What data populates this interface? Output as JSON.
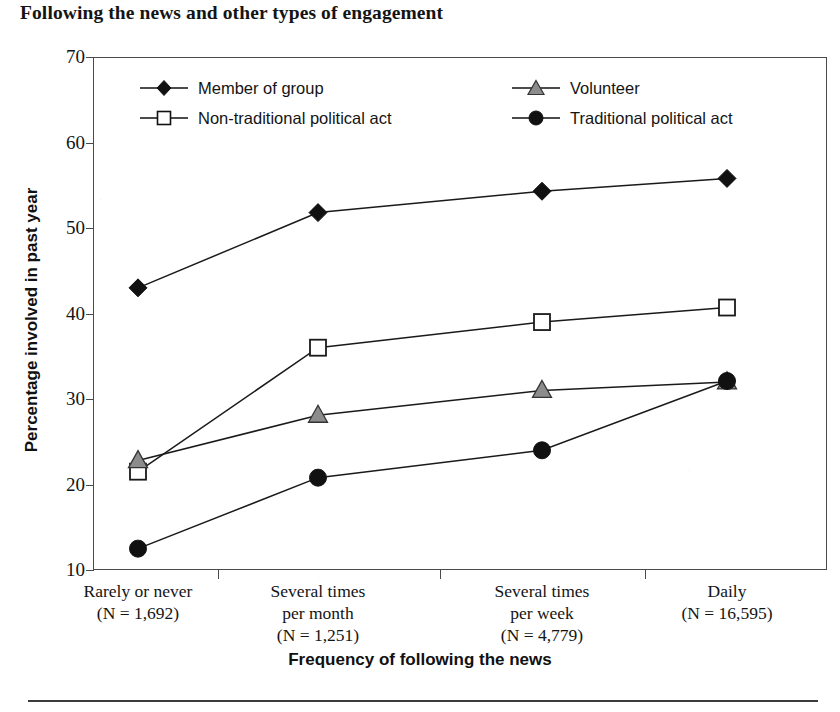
{
  "title": "Following the news and other types of engagement",
  "axis": {
    "y_title": "Percentage involved in past year",
    "x_title": "Frequency of following the news",
    "y_ticks": [
      "70",
      "60",
      "50",
      "40",
      "30",
      "20",
      "10"
    ]
  },
  "legend": {
    "member": "Member of group",
    "nontraditional": "Non-traditional political act",
    "volunteer": "Volunteer",
    "traditional": "Traditional political act"
  },
  "categories": [
    {
      "line1": "Rarely or never",
      "line2": "",
      "n": "(N = 1,692)"
    },
    {
      "line1": "Several times",
      "line2": "per month",
      "n": "(N = 1,251)"
    },
    {
      "line1": "Several times",
      "line2": "per week",
      "n": "(N = 4,779)"
    },
    {
      "line1": "Daily",
      "line2": "",
      "n": "(N = 16,595)"
    }
  ],
  "chart_data": {
    "type": "line",
    "title": "Following the news and other types of engagement",
    "xlabel": "Frequency of following the news",
    "ylabel": "Percentage involved in past year",
    "categories": [
      "Rarely or never (N = 1,692)",
      "Several times per month (N = 1,251)",
      "Several times per week (N = 4,779)",
      "Daily (N = 16,595)"
    ],
    "ylim": [
      10,
      70
    ],
    "yticks": [
      10,
      20,
      30,
      40,
      50,
      60,
      70
    ],
    "grid": false,
    "legend_position": "top-inside",
    "series": [
      {
        "name": "Member of group",
        "marker": "filled-diamond",
        "color": "#111111",
        "values": [
          43.0,
          51.8,
          54.3,
          55.8
        ]
      },
      {
        "name": "Non-traditional political act",
        "marker": "open-square",
        "color": "#ffffff",
        "values": [
          21.5,
          36.0,
          39.0,
          40.7
        ]
      },
      {
        "name": "Volunteer",
        "marker": "gray-triangle",
        "color": "#8c8c8c",
        "values": [
          22.8,
          28.1,
          31.0,
          32.0
        ]
      },
      {
        "name": "Traditional political act",
        "marker": "filled-circle",
        "color": "#111111",
        "values": [
          12.5,
          20.8,
          24.0,
          32.1
        ]
      }
    ]
  },
  "geometry": {
    "plot_left": 93,
    "plot_right": 827,
    "plot_top": 57,
    "plot_bottom": 570,
    "x_positions": [
      138,
      318,
      542,
      727
    ]
  }
}
